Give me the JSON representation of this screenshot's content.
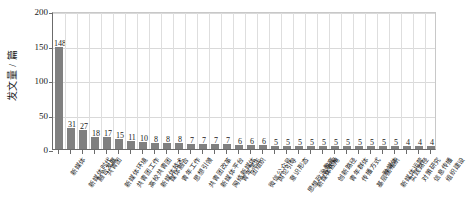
{
  "chart_data": {
    "type": "bar",
    "title": "",
    "subtitle": "",
    "xlabel": "",
    "ylabel": "发文量 / 篇",
    "ylim": [
      0,
      200
    ],
    "yticks": [
      0,
      50,
      100,
      150,
      200
    ],
    "grid": "both",
    "legend": "none",
    "bar_color": "#808080",
    "categories": [
      "新媒体",
      "新媒体时代",
      "融合发展",
      "共青团",
      "新媒体环境",
      "共青团工作",
      "高校共青团",
      "新媒体技术",
      "媒体融合",
      "青年工作",
      "思想引领",
      "共青团改革",
      "新媒体平台",
      "网络新媒体",
      "青年学生",
      "团组织",
      "微信公众号",
      "舆论引导",
      "意识形态",
      "思想政治教育",
      "新媒体应用",
      "互联网",
      "创新路径",
      "青年群体",
      "传播方式",
      "基层团组织",
      "融媒体",
      "新媒体运营",
      "实践路径",
      "对策研究",
      "信息传播",
      "组织建设"
    ],
    "values": [
      148,
      31,
      27,
      18,
      17,
      15,
      11,
      10,
      8,
      8,
      8,
      7,
      7,
      7,
      7,
      6,
      6,
      6,
      5,
      5,
      5,
      5,
      5,
      5,
      5,
      5,
      5,
      5,
      5,
      4,
      4,
      4
    ],
    "value_labels": [
      "148",
      "31",
      "27",
      "18",
      "17",
      "15",
      "11",
      "10",
      "8",
      "8",
      "8",
      "7",
      "7",
      "7",
      "7",
      "6",
      "6",
      "6",
      "5",
      "5",
      "5",
      "5",
      "5",
      "5",
      "5",
      "5",
      "5",
      "5",
      "5",
      "4",
      "4",
      "4"
    ]
  }
}
